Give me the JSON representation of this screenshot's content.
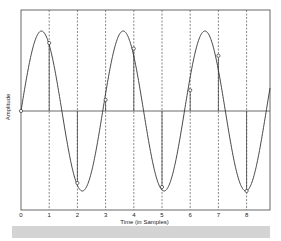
{
  "chart_data": {
    "type": "line",
    "title": "",
    "xlabel": "Time (in Samples)",
    "ylabel": "Amplitude",
    "x_ticks": [
      "0",
      "1",
      "2",
      "3",
      "4",
      "5",
      "6",
      "7",
      "8"
    ],
    "xlim": [
      0,
      8.8
    ],
    "ylim": [
      -1.1,
      1.0
    ],
    "grid": "vertical dashed lines at each sample",
    "legend": null,
    "series": [
      {
        "name": "continuous sine",
        "style": "solid line",
        "frequency_cycles_per_sample": 0.345,
        "amplitude": 1.0
      },
      {
        "name": "samples",
        "style": "open circles with stems",
        "x": [
          0,
          1,
          2,
          3,
          4,
          5,
          6,
          7,
          8
        ],
        "values": [
          0.0,
          0.85,
          -0.9,
          0.14,
          0.78,
          -0.95,
          0.26,
          0.69,
          -1.0
        ]
      }
    ]
  },
  "labels": {
    "xlabel": "Time (in Samples)",
    "ylabel": "Amplitude"
  },
  "colors": {
    "line": "#333333",
    "grid": "#555555",
    "bar": "#d4d4d4"
  }
}
